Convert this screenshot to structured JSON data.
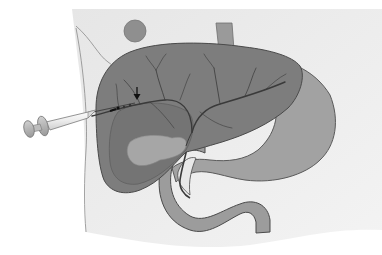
{
  "illustration": {
    "subject": "Percutaneous needle injection into intrahepatic bile duct",
    "width": 382,
    "height": 255,
    "colors": {
      "background": "#ffffff",
      "body_wall": "#e4e4e4",
      "liver": "#7d7d7d",
      "liver_outline": "#4a4a4a",
      "gallbladder": "#a6a6a6",
      "stomach": "#a2a2a2",
      "duodenum": "#9c9c9c",
      "umbilicus": "#8f8f8f",
      "esophagus": "#9a9a9a",
      "syringe_body": "#eeeeee",
      "syringe_plunger": "#b4b4b4",
      "duct_line": "#3a3a3a",
      "arrow": "#111111"
    },
    "parts": [
      {
        "name": "body-wall",
        "label": "Body wall"
      },
      {
        "name": "umbilicus",
        "label": "Umbilicus"
      },
      {
        "name": "esophagus",
        "label": "Esophagus"
      },
      {
        "name": "liver",
        "label": "Liver"
      },
      {
        "name": "gallbladder",
        "label": "Gallbladder"
      },
      {
        "name": "bile-ducts",
        "label": "Bile ducts"
      },
      {
        "name": "stomach",
        "label": "Stomach"
      },
      {
        "name": "duodenum",
        "label": "Duodenum"
      },
      {
        "name": "syringe",
        "label": "Syringe with needle"
      },
      {
        "name": "indicator-arrow",
        "label": "Arrow"
      }
    ]
  }
}
